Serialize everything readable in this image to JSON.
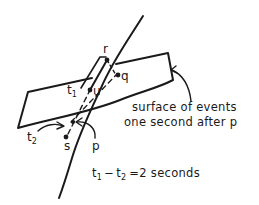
{
  "diagram": {
    "type": "spacetime-diagram",
    "points": [
      {
        "id": "r",
        "label": "r"
      },
      {
        "id": "q",
        "label": "q"
      },
      {
        "id": "u",
        "label": "u"
      },
      {
        "id": "s",
        "label": "s"
      },
      {
        "id": "p",
        "label": "p"
      }
    ],
    "time_labels": {
      "t1": {
        "base": "t",
        "sub": "1"
      },
      "t2": {
        "base": "t",
        "sub": "2"
      }
    },
    "surface_caption": {
      "line1": "surface of events",
      "line2": "one second after p"
    },
    "equation": {
      "t1_base": "t",
      "t1_sub": "1",
      "minus": "−",
      "t2_base": "t",
      "t2_sub": "2",
      "rhs": "=2 seconds"
    }
  }
}
